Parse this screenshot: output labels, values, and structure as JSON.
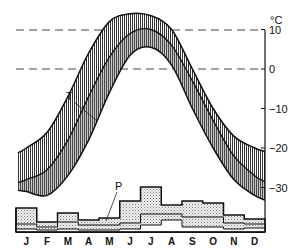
{
  "chart_data": {
    "type": "line",
    "title": "",
    "xlabel": "",
    "ylabel": "°C",
    "unit_label": "°C",
    "ylim": [
      -37,
      13
    ],
    "y_ticks": [
      10,
      0,
      -10,
      -20,
      -30
    ],
    "y_tick_labels": [
      "10",
      "0",
      "−10",
      "−20",
      "−30"
    ],
    "dashed_reference_lines": [
      10,
      0
    ],
    "categories": [
      "J",
      "F",
      "M",
      "A",
      "M",
      "J",
      "J",
      "A",
      "S",
      "O",
      "N",
      "D"
    ],
    "temperature": {
      "label": "T",
      "description": "Monthly temperature band with mean curve (hatched band)",
      "mean": [
        -28,
        -25.5,
        -18,
        -7,
        3,
        9,
        10,
        6,
        -3,
        -13,
        -22,
        -27
      ],
      "upper": [
        -20,
        -16,
        -7,
        4,
        12,
        14,
        13.5,
        10,
        0,
        -10,
        -17,
        -20
      ],
      "lower": [
        -31,
        -32,
        -27,
        -18,
        -6,
        3.5,
        5.5,
        1,
        -10,
        -20,
        -28,
        -32
      ]
    },
    "precipitation": {
      "label": "P",
      "description": "Monthly precipitation step bars (stippled, three nested levels)",
      "units": "relative bar height (px)",
      "series": [
        {
          "name": "upper",
          "values": [
            24,
            10,
            19,
            12,
            14,
            31,
            45,
            27,
            31,
            29,
            17,
            13
          ]
        },
        {
          "name": "middle",
          "values": [
            8,
            5,
            10,
            7,
            7,
            9,
            18,
            18,
            15,
            15,
            9,
            8
          ]
        },
        {
          "name": "lower",
          "values": [
            3,
            2,
            3,
            2,
            2,
            3,
            7,
            12,
            5,
            5,
            3,
            4
          ]
        }
      ]
    },
    "grid": false,
    "legend": "inline labels T and P"
  }
}
